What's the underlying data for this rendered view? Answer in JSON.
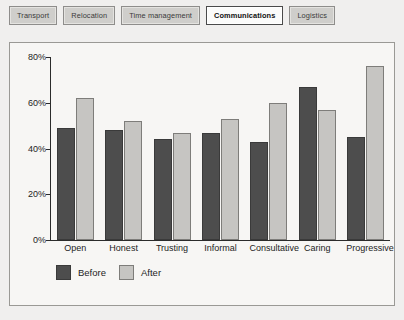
{
  "tabs": [
    {
      "label": "Transport",
      "selected": false
    },
    {
      "label": "Relocation",
      "selected": false
    },
    {
      "label": "Time management",
      "selected": false
    },
    {
      "label": "Communications",
      "selected": true
    },
    {
      "label": "Logistics",
      "selected": false
    }
  ],
  "colors": {
    "before": "#4d4d4d",
    "after": "#c6c5c2",
    "panel_background": "#f7f6f4",
    "page_background": "#f0efee",
    "axis": "#2b2b2b",
    "tab_background": "#cfcecb",
    "tab_selected_background": "#fbfbfa"
  },
  "chart_data": {
    "type": "bar",
    "title": "",
    "xlabel": "",
    "ylabel": "",
    "ylim": [
      0,
      80
    ],
    "grid": false,
    "legend_position": "bottom-left",
    "ytick_labels": [
      "80%",
      "60%",
      "40%",
      "20%",
      "0%"
    ],
    "ytick_values": [
      80,
      60,
      40,
      20,
      0
    ],
    "categories": [
      "Open",
      "Honest",
      "Trusting",
      "Informal",
      "Consultative",
      "Caring",
      "Progressive"
    ],
    "series": [
      {
        "name": "Before",
        "color": "#4d4d4d",
        "values": [
          49,
          48,
          44,
          47,
          43,
          67,
          45
        ]
      },
      {
        "name": "After",
        "color": "#c6c5c2",
        "values": [
          62,
          52,
          47,
          53,
          60,
          57,
          76
        ]
      }
    ]
  }
}
